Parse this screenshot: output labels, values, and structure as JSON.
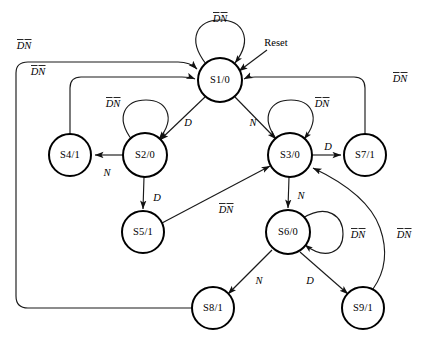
{
  "diagram": {
    "reset_label": "Reset",
    "colors": {
      "node_fill": "#ffffff",
      "node_stroke": "#000000",
      "edge_stroke": "#1a1a1a",
      "background": "#ffffff"
    },
    "states": [
      {
        "id": "S1",
        "label": "S1/0",
        "name": "S1",
        "output": "0",
        "cx": 220,
        "cy": 80,
        "r": 22
      },
      {
        "id": "S2",
        "label": "S2/0",
        "name": "S2",
        "output": "0",
        "cx": 145,
        "cy": 155,
        "r": 22
      },
      {
        "id": "S3",
        "label": "S3/0",
        "name": "S3",
        "output": "0",
        "cx": 290,
        "cy": 155,
        "r": 22
      },
      {
        "id": "S4",
        "label": "S4/1",
        "name": "S4",
        "output": "1",
        "cx": 70,
        "cy": 155,
        "r": 21
      },
      {
        "id": "S5",
        "label": "S5/1",
        "name": "S5",
        "output": "1",
        "cx": 143,
        "cy": 232,
        "r": 21
      },
      {
        "id": "S6",
        "label": "S6/0",
        "name": "S6",
        "output": "0",
        "cx": 288,
        "cy": 232,
        "r": 22
      },
      {
        "id": "S7",
        "label": "S7/1",
        "name": "S7",
        "output": "1",
        "cx": 365,
        "cy": 155,
        "r": 21
      },
      {
        "id": "S8",
        "label": "S8/1",
        "name": "S8",
        "output": "1",
        "cx": 213,
        "cy": 308,
        "r": 21
      },
      {
        "id": "S9",
        "label": "S9/1",
        "name": "S9",
        "output": "1",
        "cx": 363,
        "cy": 308,
        "r": 21
      }
    ],
    "self_loops": [
      {
        "id": "loop-s1",
        "state": "S1",
        "label": "DN",
        "label_x": 220,
        "label_y": 19,
        "overbars": "both"
      },
      {
        "id": "loop-s2",
        "state": "S2",
        "label": "DN",
        "label_x": 113,
        "label_y": 104,
        "overbars": "both"
      },
      {
        "id": "loop-s3",
        "state": "S3",
        "label": "DN",
        "label_x": 320,
        "label_y": 104,
        "overbars": "both"
      },
      {
        "id": "loop-s6",
        "state": "S6",
        "label": "DN",
        "label_x": 340,
        "label_y": 235,
        "overbars": "both"
      }
    ],
    "transitions": [
      {
        "id": "t-s1-s2",
        "from": "S1",
        "to": "S2",
        "label": "D",
        "label_x": 188,
        "label_y": 122,
        "overbars": "none"
      },
      {
        "id": "t-s1-s3",
        "from": "S1",
        "to": "S3",
        "label": "N",
        "label_x": 252,
        "label_y": 122,
        "overbars": "none"
      },
      {
        "id": "t-s2-s4",
        "from": "S2",
        "to": "S4",
        "label": "N",
        "label_x": 107,
        "label_y": 173,
        "overbars": "none"
      },
      {
        "id": "t-s2-s5",
        "from": "S2",
        "to": "S5",
        "label": "D",
        "label_x": 156,
        "label_y": 198,
        "overbars": "none"
      },
      {
        "id": "t-s3-s7",
        "from": "S3",
        "to": "S7",
        "label": "D",
        "label_x": 328,
        "label_y": 147,
        "overbars": "none"
      },
      {
        "id": "t-s3-s6",
        "from": "S3",
        "to": "S6",
        "label": "N",
        "label_x": 300,
        "label_y": 196,
        "overbars": "none"
      },
      {
        "id": "t-s6-s8",
        "from": "S6",
        "to": "S8",
        "label": "N",
        "label_x": 258,
        "label_y": 281,
        "overbars": "none"
      },
      {
        "id": "t-s6-s9",
        "from": "S6",
        "to": "S9",
        "label": "D",
        "label_x": 308,
        "label_y": 281,
        "overbars": "none"
      },
      {
        "id": "t-s5-s3",
        "from": "S5",
        "to": "S3",
        "label": "DN",
        "label_x": 225,
        "label_y": 210,
        "overbars": "both"
      },
      {
        "id": "t-s4-s1",
        "from": "S4",
        "to": "S1",
        "label": "DN",
        "label_x": 37,
        "label_y": 72,
        "overbars": "both"
      },
      {
        "id": "t-s8-s1",
        "from": "S8",
        "to": "S1",
        "label": "DN",
        "label_x": 24,
        "label_y": 46,
        "overbars": "both"
      },
      {
        "id": "t-s7-s1",
        "from": "S7",
        "to": "S1",
        "label": "DN",
        "label_x": 399,
        "label_y": 79,
        "overbars": "both"
      },
      {
        "id": "t-s9-s3",
        "from": "S9",
        "to": "S3",
        "label": "DN",
        "label_x": 401,
        "label_y": 235,
        "overbars": "both"
      }
    ],
    "reset": {
      "label": "Reset",
      "label_x": 276,
      "label_y": 43,
      "target": "S1"
    }
  }
}
